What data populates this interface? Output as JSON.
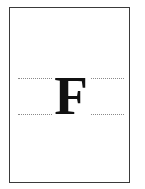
{
  "figure": {
    "letter": "F",
    "guides": [
      "top-dotted-guide",
      "bottom-dotted-guide"
    ],
    "colors": {
      "border": "#3a3a3a",
      "letter": "#111111",
      "guides": "#8a8a8a",
      "background": "#ffffff"
    }
  }
}
